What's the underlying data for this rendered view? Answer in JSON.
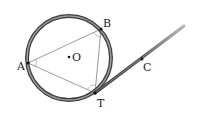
{
  "diagram": {
    "points": {
      "A": {
        "label": "A",
        "x": 28,
        "y": 63
      },
      "B": {
        "label": "B",
        "x": 101,
        "y": 29
      },
      "T": {
        "label": "T",
        "x": 95,
        "y": 93
      },
      "C": {
        "label": "C",
        "x": 142,
        "y": 59
      },
      "O": {
        "label": "O",
        "x": 69,
        "y": 57
      }
    },
    "circle": {
      "cx": 69,
      "cy": 58,
      "r": 42
    },
    "tangent_end": {
      "x": 184,
      "y": 26
    },
    "colors": {
      "circle_stroke": "#555555",
      "circle_inner": "#9a9a9a",
      "line": "#555555",
      "tangent_gradient_start": "#444444",
      "tangent_gradient_end": "#b0b0b0"
    }
  }
}
